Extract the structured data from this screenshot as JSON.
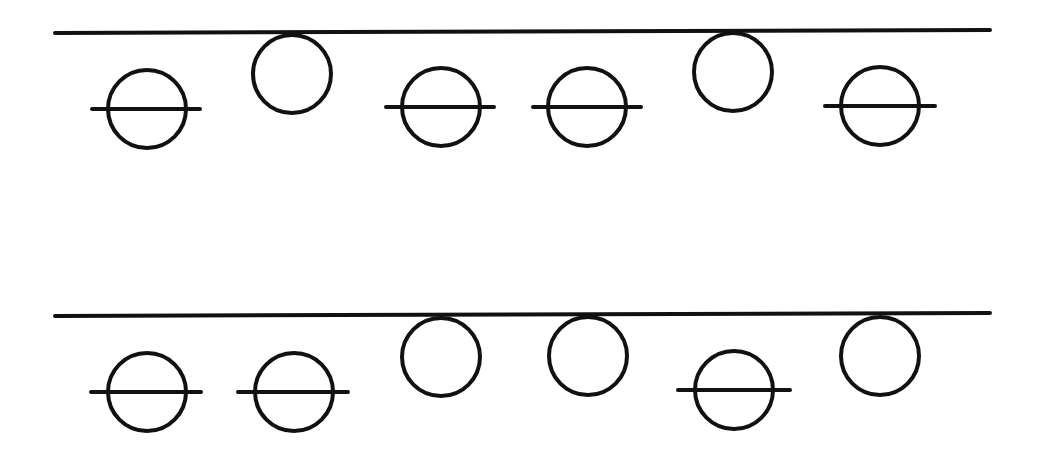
{
  "diagram": {
    "stroke_color": "#111111",
    "background": "#ffffff",
    "circle_radius": 39,
    "stroke_width": 4,
    "rows": [
      {
        "line": {
          "x1": 55,
          "y1": 33,
          "x2": 990,
          "y2": 30
        },
        "items": [
          {
            "type": "crossed-circle",
            "cx": 147,
            "cy": 109,
            "bar_x1": 92,
            "bar_x2": 200
          },
          {
            "type": "hanging-circle",
            "cx": 292,
            "cy": 74
          },
          {
            "type": "crossed-circle",
            "cx": 441,
            "cy": 107,
            "bar_x1": 386,
            "bar_x2": 494
          },
          {
            "type": "crossed-circle",
            "cx": 587,
            "cy": 107,
            "bar_x1": 533,
            "bar_x2": 641
          },
          {
            "type": "hanging-circle",
            "cx": 733,
            "cy": 72
          },
          {
            "type": "crossed-circle",
            "cx": 880,
            "cy": 106,
            "bar_x1": 825,
            "bar_x2": 935
          }
        ]
      },
      {
        "line": {
          "x1": 55,
          "y1": 316,
          "x2": 990,
          "y2": 313
        },
        "items": [
          {
            "type": "crossed-circle",
            "cx": 147,
            "cy": 392,
            "bar_x1": 91,
            "bar_x2": 201
          },
          {
            "type": "crossed-circle",
            "cx": 294,
            "cy": 392,
            "bar_x1": 238,
            "bar_x2": 348
          },
          {
            "type": "hanging-circle",
            "cx": 441,
            "cy": 357
          },
          {
            "type": "hanging-circle",
            "cx": 588,
            "cy": 356
          },
          {
            "type": "crossed-circle",
            "cx": 734,
            "cy": 390,
            "bar_x1": 678,
            "bar_x2": 790
          },
          {
            "type": "hanging-circle",
            "cx": 880,
            "cy": 356
          }
        ]
      }
    ]
  }
}
